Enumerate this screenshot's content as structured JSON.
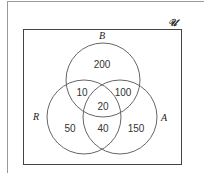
{
  "diagram": {
    "type": "venn",
    "universe_label": "𝒰",
    "sets": [
      {
        "name": "B",
        "label": "B"
      },
      {
        "name": "R",
        "label": "R"
      },
      {
        "name": "A",
        "label": "A"
      }
    ],
    "regions": {
      "B_only": "200",
      "R_and_B_only": "10",
      "B_and_A_only": "100",
      "R_and_B_and_A": "20",
      "R_only": "50",
      "R_and_A_only": "40",
      "A_only": "150"
    },
    "colors": {
      "stroke": "#555555",
      "frame": "#444444",
      "text": "#333333"
    }
  }
}
